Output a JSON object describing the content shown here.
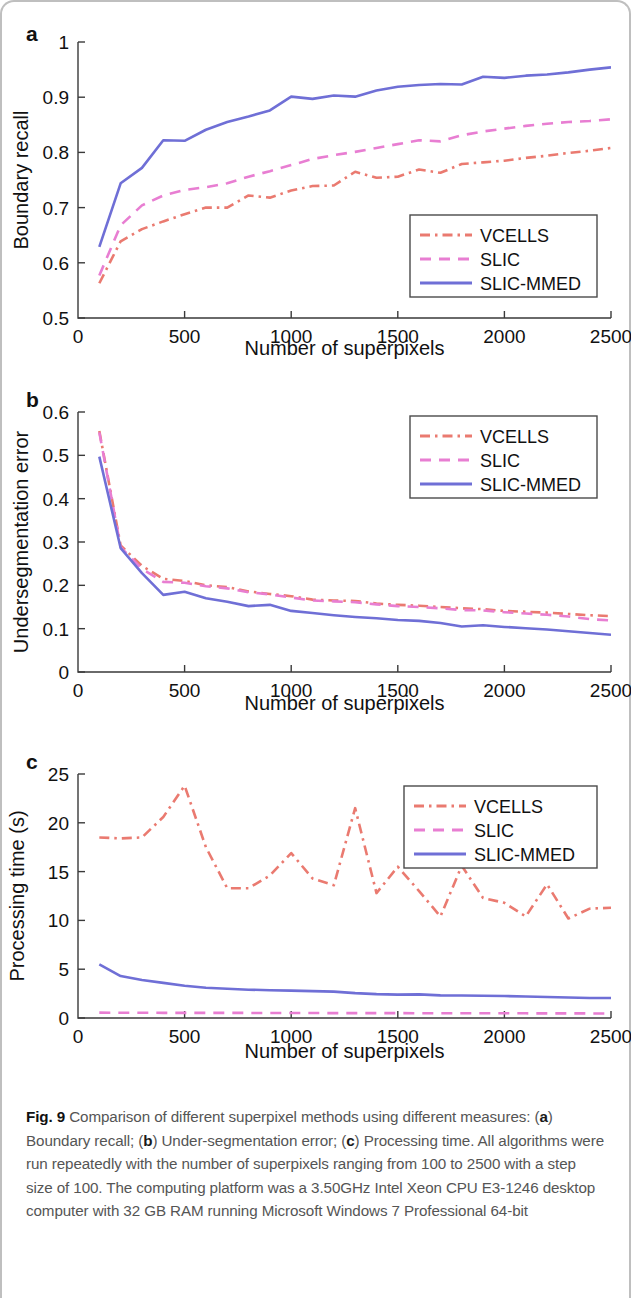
{
  "figure": {
    "caption_label": "Fig. 9",
    "caption_text_1": " Comparison of different superpixel methods using different measures: (",
    "caption_a": "a",
    "caption_text_2": ") Boundary recall; (",
    "caption_b": "b",
    "caption_text_3": ") Under-segmentation error; (",
    "caption_c": "c",
    "caption_text_4": ") Processing time. All algorithms were run repeatedly with the number of superpixels ranging from 100 to 2500 with a step size of 100. The computing platform was a 3.50GHz Intel Xeon CPU E3-1246 desktop computer with 32 GB RAM running Microsoft Windows 7 Professional 64-bit"
  },
  "panels": {
    "a": {
      "letter": "a"
    },
    "b": {
      "letter": "b"
    },
    "c": {
      "letter": "c"
    }
  },
  "colors": {
    "vcells": "#ea7a70",
    "slic": "#e87ed2",
    "slic_mmed": "#6f6fd6",
    "axis": "#3a3a3a",
    "text": "#111111",
    "caption": "#555555"
  },
  "chart_data": [
    {
      "id": "panel-a",
      "type": "line",
      "title": "",
      "xlabel": "Number of superpixels",
      "ylabel": "Boundary recall",
      "xlim": [
        0,
        2500
      ],
      "ylim": [
        0.5,
        1.0
      ],
      "xticks": [
        0,
        500,
        1000,
        1500,
        2000,
        2500
      ],
      "xticklabels": [
        "0",
        "500",
        "1000",
        "1500",
        "2000",
        "2500"
      ],
      "yticks": [
        0.5,
        0.6,
        0.7,
        0.8,
        0.9,
        1.0
      ],
      "yticklabels": [
        "0.5",
        "0.6",
        "0.7",
        "0.8",
        "0.9",
        "1"
      ],
      "grid": false,
      "legend_position": "lower-right",
      "x": [
        100,
        200,
        300,
        400,
        500,
        600,
        700,
        800,
        900,
        1000,
        1100,
        1200,
        1300,
        1400,
        1500,
        1600,
        1700,
        1800,
        1900,
        2000,
        2100,
        2200,
        2300,
        2400,
        2500
      ],
      "series": [
        {
          "name": "VCELLS",
          "style": "dashdot",
          "color": "#ea7a70",
          "values": [
            0.563,
            0.639,
            0.661,
            0.675,
            0.688,
            0.7,
            0.7,
            0.722,
            0.718,
            0.731,
            0.739,
            0.74,
            0.765,
            0.754,
            0.756,
            0.769,
            0.763,
            0.779,
            0.782,
            0.785,
            0.79,
            0.794,
            0.799,
            0.803,
            0.808
          ]
        },
        {
          "name": "SLIC",
          "style": "dashed",
          "color": "#e87ed2",
          "values": [
            0.577,
            0.668,
            0.704,
            0.722,
            0.732,
            0.737,
            0.744,
            0.756,
            0.766,
            0.777,
            0.788,
            0.795,
            0.801,
            0.808,
            0.815,
            0.822,
            0.82,
            0.831,
            0.838,
            0.843,
            0.848,
            0.852,
            0.855,
            0.857,
            0.86
          ]
        },
        {
          "name": "SLIC-MMED",
          "style": "solid",
          "color": "#6f6fd6",
          "values": [
            0.629,
            0.744,
            0.772,
            0.822,
            0.821,
            0.841,
            0.855,
            0.865,
            0.876,
            0.901,
            0.897,
            0.903,
            0.901,
            0.912,
            0.919,
            0.922,
            0.924,
            0.923,
            0.937,
            0.935,
            0.939,
            0.941,
            0.945,
            0.95,
            0.954
          ]
        }
      ]
    },
    {
      "id": "panel-b",
      "type": "line",
      "title": "",
      "xlabel": "Number of superpixels",
      "ylabel": "Undersegmentation error",
      "xlim": [
        0,
        2500
      ],
      "ylim": [
        0,
        0.6
      ],
      "xticks": [
        0,
        500,
        1000,
        1500,
        2000,
        2500
      ],
      "xticklabels": [
        "0",
        "500",
        "1000",
        "1500",
        "2000",
        "2500"
      ],
      "yticks": [
        0,
        0.1,
        0.2,
        0.3,
        0.4,
        0.5,
        0.6
      ],
      "yticklabels": [
        "0",
        "0.1",
        "0.2",
        "0.3",
        "0.4",
        "0.5",
        "0.6"
      ],
      "grid": false,
      "legend_position": "upper-right",
      "x": [
        100,
        200,
        300,
        400,
        500,
        600,
        700,
        800,
        900,
        1000,
        1100,
        1200,
        1300,
        1400,
        1500,
        1600,
        1700,
        1800,
        1900,
        2000,
        2100,
        2200,
        2300,
        2400,
        2500
      ],
      "series": [
        {
          "name": "VCELLS",
          "style": "dashdot",
          "color": "#ea7a70",
          "values": [
            0.556,
            0.292,
            0.245,
            0.215,
            0.21,
            0.2,
            0.196,
            0.186,
            0.18,
            0.175,
            0.167,
            0.165,
            0.164,
            0.158,
            0.155,
            0.153,
            0.15,
            0.147,
            0.145,
            0.141,
            0.139,
            0.137,
            0.134,
            0.131,
            0.129
          ]
        },
        {
          "name": "SLIC",
          "style": "dashed",
          "color": "#e87ed2",
          "values": [
            0.553,
            0.288,
            0.238,
            0.208,
            0.206,
            0.198,
            0.193,
            0.184,
            0.179,
            0.172,
            0.165,
            0.163,
            0.161,
            0.156,
            0.152,
            0.15,
            0.147,
            0.143,
            0.142,
            0.138,
            0.135,
            0.132,
            0.128,
            0.122,
            0.119
          ]
        },
        {
          "name": "SLIC-MMED",
          "style": "solid",
          "color": "#6f6fd6",
          "values": [
            0.497,
            0.286,
            0.228,
            0.178,
            0.185,
            0.17,
            0.162,
            0.152,
            0.155,
            0.141,
            0.136,
            0.131,
            0.127,
            0.124,
            0.12,
            0.118,
            0.113,
            0.105,
            0.108,
            0.104,
            0.101,
            0.098,
            0.094,
            0.09,
            0.086
          ]
        }
      ]
    },
    {
      "id": "panel-c",
      "type": "line",
      "title": "",
      "xlabel": "Number of superpixels",
      "ylabel": "Processing time (s)",
      "xlim": [
        0,
        2500
      ],
      "ylim": [
        0,
        25
      ],
      "xticks": [
        0,
        500,
        1000,
        1500,
        2000,
        2500
      ],
      "xticklabels": [
        "0",
        "500",
        "1000",
        "1500",
        "2000",
        "2500"
      ],
      "yticks": [
        0,
        5,
        10,
        15,
        20,
        25
      ],
      "yticklabels": [
        "0",
        "5",
        "10",
        "15",
        "20",
        "25"
      ],
      "grid": false,
      "legend_position": "upper-right",
      "x": [
        100,
        200,
        300,
        400,
        500,
        600,
        700,
        800,
        900,
        1000,
        1100,
        1200,
        1300,
        1400,
        1500,
        1600,
        1700,
        1800,
        1900,
        2000,
        2100,
        2200,
        2300,
        2400,
        2500
      ],
      "series": [
        {
          "name": "VCELLS",
          "style": "dashdot",
          "color": "#ea7a70",
          "values": [
            18.5,
            18.4,
            18.5,
            20.6,
            23.8,
            17.5,
            13.3,
            13.3,
            14.6,
            16.9,
            14.3,
            13.6,
            21.5,
            12.8,
            15.5,
            13.0,
            10.4,
            15.6,
            12.3,
            11.8,
            10.4,
            13.7,
            10.2,
            11.2,
            11.3
          ]
        },
        {
          "name": "SLIC",
          "style": "dashed",
          "color": "#e87ed2",
          "values": [
            0.55,
            0.54,
            0.54,
            0.53,
            0.53,
            0.52,
            0.52,
            0.52,
            0.51,
            0.51,
            0.51,
            0.5,
            0.5,
            0.5,
            0.5,
            0.49,
            0.49,
            0.49,
            0.48,
            0.48,
            0.48,
            0.47,
            0.47,
            0.47,
            0.46
          ]
        },
        {
          "name": "SLIC-MMED",
          "style": "solid",
          "color": "#6f6fd6",
          "values": [
            5.5,
            4.3,
            3.9,
            3.6,
            3.3,
            3.1,
            3.0,
            2.9,
            2.85,
            2.8,
            2.75,
            2.7,
            2.55,
            2.45,
            2.4,
            2.42,
            2.32,
            2.3,
            2.28,
            2.25,
            2.2,
            2.15,
            2.1,
            2.05,
            2.05
          ]
        }
      ]
    }
  ]
}
